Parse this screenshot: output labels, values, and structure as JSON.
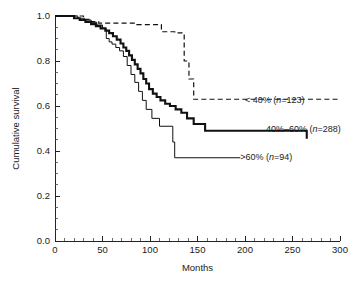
{
  "chart_data": {
    "type": "line",
    "subtype": "kaplan-meier-step",
    "title": "",
    "xlabel": "Months",
    "ylabel": "Cumulative survival",
    "xlim": [
      0,
      300
    ],
    "ylim": [
      0.0,
      1.0
    ],
    "xticks": [
      0,
      50,
      100,
      150,
      200,
      250,
      300
    ],
    "xticklabels": [
      "0",
      "50",
      "100",
      "150",
      "200",
      "250",
      "300"
    ],
    "x_minor_tick_interval": 10,
    "yticks": [
      0.0,
      0.2,
      0.4,
      0.6,
      0.8,
      1.0
    ],
    "yticklabels": [
      "0.0",
      "0.2",
      "0.4",
      "0.6",
      "0.8",
      "1.0"
    ],
    "y_minor_tick_interval": 0.05,
    "grid": false,
    "legend_position": "inline-right-of-curves",
    "series": [
      {
        "name": "< 40%",
        "group_label": "< 40%",
        "n": 123,
        "label_text": "< 40% (n=123)",
        "label_prefix": "< 40% (",
        "label_italic": "n",
        "label_suffix": "=123)",
        "style": "dashed",
        "stroke": "#111111",
        "stroke_width": 1.2,
        "label_x": 200,
        "label_y": 0.628,
        "x": [
          0,
          18,
          30,
          38,
          46,
          76,
          86,
          104,
          112,
          118,
          126,
          132,
          136,
          141,
          146,
          300
        ],
        "y": [
          1.0,
          1.0,
          0.985,
          0.975,
          0.968,
          0.968,
          0.962,
          0.962,
          0.93,
          0.93,
          0.925,
          0.925,
          0.8,
          0.72,
          0.63,
          0.63
        ]
      },
      {
        "name": "40%-60%",
        "group_label": "40%–60%",
        "n": 288,
        "label_text": "40%–60% (n=288)",
        "label_prefix": "40%–60% (",
        "label_italic": "n",
        "label_suffix": "=288)",
        "style": "solid-thick",
        "stroke": "#111111",
        "stroke_width": 2.1,
        "label_x": 222,
        "label_y": 0.5,
        "x": [
          0,
          14,
          20,
          26,
          32,
          38,
          43,
          48,
          53,
          57,
          61,
          65,
          69,
          72,
          75,
          78,
          81,
          84,
          87,
          90,
          93,
          96,
          99,
          103,
          107,
          111,
          116,
          121,
          127,
          133,
          139,
          146,
          158,
          265
        ],
        "y": [
          1.0,
          1.0,
          0.99,
          0.982,
          0.974,
          0.964,
          0.955,
          0.945,
          0.935,
          0.924,
          0.91,
          0.895,
          0.878,
          0.86,
          0.845,
          0.825,
          0.805,
          0.785,
          0.765,
          0.745,
          0.72,
          0.7,
          0.675,
          0.655,
          0.64,
          0.625,
          0.61,
          0.6,
          0.585,
          0.57,
          0.545,
          0.52,
          0.49,
          0.455
        ]
      },
      {
        "name": "> 60%",
        "group_label": ">60%",
        "n": 94,
        "label_text": ">60% (n=94)",
        "label_prefix": ">60% (",
        "label_italic": "n",
        "label_suffix": "=94)",
        "style": "solid-thin",
        "stroke": "#222222",
        "stroke_width": 1,
        "label_x": 195,
        "label_y": 0.375,
        "x": [
          0,
          16,
          24,
          31,
          38,
          44,
          50,
          54,
          57,
          60,
          64,
          68,
          72,
          76,
          80,
          84,
          88,
          92,
          96,
          102,
          110,
          118,
          124,
          126,
          195
        ],
        "y": [
          1.0,
          1.0,
          0.99,
          0.982,
          0.972,
          0.96,
          0.945,
          0.9,
          0.885,
          0.875,
          0.86,
          0.845,
          0.82,
          0.78,
          0.74,
          0.705,
          0.665,
          0.625,
          0.585,
          0.545,
          0.51,
          0.51,
          0.44,
          0.37,
          0.37
        ]
      }
    ]
  },
  "geometry": {
    "plot_left": 55,
    "plot_right": 340,
    "plot_top": 16,
    "plot_bottom": 241
  }
}
